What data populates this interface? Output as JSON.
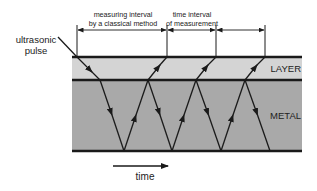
{
  "labels": {
    "pulse_line1": "ultrasonic",
    "pulse_line2": "pulse",
    "classical_line1": "measuring interval",
    "classical_line2": "by a classical method",
    "interval_line1": "time interval",
    "interval_line2": "of measurement",
    "layer": "LAYER",
    "metal": "METAL",
    "time": "time"
  },
  "colors": {
    "layer_fill": "#d4d4d4",
    "metal_fill": "#a9a9a9",
    "line": "#1a1a1a"
  },
  "geometry": {
    "plate_left": 72,
    "plate_right": 302,
    "layer_top_y": 57,
    "boundary_y": 80,
    "metal_bottom_y": 151,
    "dimension_y": 30,
    "marker_x": [
      77,
      167,
      216,
      265
    ],
    "boundary_points_x": [
      100,
      148,
      196,
      245
    ],
    "bottom_points_x": [
      124,
      172,
      221,
      270
    ]
  }
}
